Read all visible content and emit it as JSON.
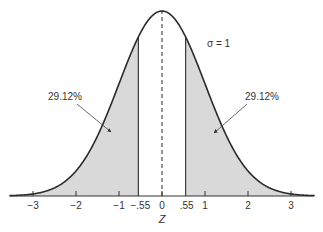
{
  "chart_data": {
    "type": "area",
    "title": "",
    "xlabel": "Z",
    "ylabel": "",
    "distribution": "standard normal",
    "sigma_label": "σ = 1",
    "mean": 0,
    "sigma": 1,
    "xlim": [
      -3.5,
      3.5
    ],
    "x_ticks": [
      -3,
      -2,
      -1,
      -0.55,
      0,
      0.55,
      1,
      2,
      3
    ],
    "x_tick_labels": [
      "−3",
      "−2",
      "−1",
      "−.55",
      "0",
      ".55",
      "1",
      "2",
      "3"
    ],
    "shaded_regions": [
      {
        "from": -3.5,
        "to": -0.55,
        "area_percent": 29.12,
        "label": "29.12%"
      },
      {
        "from": 0.55,
        "to": 3.5,
        "area_percent": 29.12,
        "label": "29.12%"
      }
    ],
    "unshaded_center": {
      "from": -0.55,
      "to": 0.55
    },
    "mean_line": {
      "x": 0,
      "style": "dashed"
    },
    "grid": false,
    "legend": "none"
  },
  "style": {
    "shade_color": "#d9d9d9",
    "curve_color": "#2b2b2b",
    "axis_color": "#333333",
    "text_color": "#333333"
  }
}
